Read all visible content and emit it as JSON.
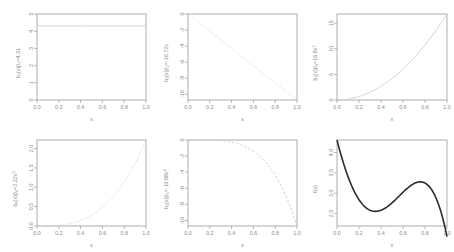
{
  "figure": {
    "layout": "2 rows x 3 columns of R base-graphics line plots",
    "background": "#ffffff",
    "light_curve_color": "#c9c9c9",
    "dark_curve_color": "#2b2b2b",
    "axis_color": "#9a9a9a",
    "text_color": "#8d8d8d"
  },
  "chart_data": [
    {
      "type": "line",
      "panel": 1,
      "title": "",
      "xlabel": "x",
      "ylabel": "b1(x)B1=4.31",
      "ylabel_parts": {
        "base": "b",
        "sub1": "1",
        "mid": "(x)β",
        "sub2": "1",
        "tail": "=4.31"
      },
      "xlim": [
        0,
        1
      ],
      "ylim": [
        0,
        5
      ],
      "xticks": [
        "0.0",
        "0.2",
        "0.4",
        "0.6",
        "0.8",
        "1.0"
      ],
      "xtickvals": [
        0,
        0.2,
        0.4,
        0.6,
        0.8,
        1
      ],
      "yticks": [
        "0",
        "1",
        "2",
        "3",
        "4",
        "5"
      ],
      "ytickvals": [
        0,
        1,
        2,
        3,
        4,
        5
      ],
      "linestyle": "solid",
      "color": "#c9c9c9",
      "expression": "4.31",
      "x": [
        0,
        0.1,
        0.2,
        0.3,
        0.4,
        0.5,
        0.6,
        0.7,
        0.8,
        0.9,
        1
      ],
      "values": [
        4.31,
        4.31,
        4.31,
        4.31,
        4.31,
        4.31,
        4.31,
        4.31,
        4.31,
        4.31,
        4.31
      ],
      "grid": false,
      "legend": "none"
    },
    {
      "type": "line",
      "panel": 2,
      "title": "",
      "xlabel": "x",
      "ylabel": "b2(x)B2=-10.72x",
      "ylabel_parts": {
        "base": "b",
        "sub1": "2",
        "mid": "(x)β",
        "sub2": "2",
        "tail": "=-10.72x"
      },
      "xlim": [
        0,
        1
      ],
      "ylim": [
        -10.72,
        0
      ],
      "xticks": [
        "0.0",
        "0.2",
        "0.4",
        "0.6",
        "0.8",
        "1.0"
      ],
      "xtickvals": [
        0,
        0.2,
        0.4,
        0.6,
        0.8,
        1
      ],
      "yticks": [
        "0",
        "-2",
        "-4",
        "-6",
        "-8",
        "-10"
      ],
      "ytickvals": [
        0,
        -2,
        -4,
        -6,
        -8,
        -10
      ],
      "linestyle": "dotted",
      "color": "#c9c9c9",
      "expression": "-10.72 * x",
      "x": [
        0,
        0.1,
        0.2,
        0.3,
        0.4,
        0.5,
        0.6,
        0.7,
        0.8,
        0.9,
        1
      ],
      "values": [
        0,
        -1.072,
        -2.144,
        -3.216,
        -4.288,
        -5.36,
        -6.432,
        -7.504,
        -8.576,
        -9.648,
        -10.72
      ],
      "grid": false,
      "legend": "none"
    },
    {
      "type": "line",
      "panel": 3,
      "title": "",
      "xlabel": "x",
      "ylabel": "b3(x)B3=16.8x2",
      "ylabel_parts": {
        "base": "b",
        "sub1": "3",
        "mid": "(x)β",
        "sub2": "3",
        "tail": "=16.8x",
        "sup": "2"
      },
      "xlim": [
        0,
        1
      ],
      "ylim": [
        0,
        16.8
      ],
      "xticks": [
        "0.0",
        "0.2",
        "0.4",
        "0.6",
        "0.8",
        "1.0"
      ],
      "xtickvals": [
        0,
        0.2,
        0.4,
        0.6,
        0.8,
        1
      ],
      "yticks": [
        "0",
        "5",
        "10",
        "15"
      ],
      "ytickvals": [
        0,
        5,
        10,
        15
      ],
      "linestyle": "solid",
      "color": "#c9c9c9",
      "expression": "16.8 * x^2",
      "x": [
        0,
        0.1,
        0.2,
        0.3,
        0.4,
        0.5,
        0.6,
        0.7,
        0.8,
        0.9,
        1
      ],
      "values": [
        0,
        0.168,
        0.672,
        1.512,
        2.688,
        4.2,
        6.048,
        8.232,
        10.752,
        13.608,
        16.8
      ],
      "grid": false,
      "legend": "none"
    },
    {
      "type": "line",
      "panel": 4,
      "title": "",
      "xlabel": "x",
      "ylabel": "b4(x)B4=2.22x3",
      "ylabel_parts": {
        "base": "b",
        "sub1": "4",
        "mid": "(x)β",
        "sub2": "4",
        "tail": "=2.22x",
        "sup": "3"
      },
      "xlim": [
        0,
        1
      ],
      "ylim": [
        0,
        2.22
      ],
      "xticks": [
        "0.0",
        "0.2",
        "0.4",
        "0.6",
        "0.8",
        "1.0"
      ],
      "xtickvals": [
        0,
        0.2,
        0.4,
        0.6,
        0.8,
        1
      ],
      "yticks": [
        "0.0",
        "0.5",
        "1.0",
        "1.5",
        "2.0"
      ],
      "ytickvals": [
        0,
        0.5,
        1,
        1.5,
        2
      ],
      "linestyle": "dotted",
      "color": "#c9c9c9",
      "expression": "2.22 * x^3",
      "x": [
        0,
        0.1,
        0.2,
        0.3,
        0.4,
        0.5,
        0.6,
        0.7,
        0.8,
        0.9,
        1
      ],
      "values": [
        0,
        0.00222,
        0.01776,
        0.05994,
        0.14208,
        0.2775,
        0.47952,
        0.76146,
        1.13664,
        1.61838,
        2.22
      ],
      "grid": false,
      "legend": "none"
    },
    {
      "type": "line",
      "panel": 5,
      "title": "",
      "xlabel": "x",
      "ylabel": "b5(x)B5=-10.68x4",
      "ylabel_parts": {
        "base": "b",
        "sub1": "5",
        "mid": "(x)β",
        "sub2": "5",
        "tail": "=-10.68x",
        "sup": "4"
      },
      "xlim": [
        0,
        1
      ],
      "ylim": [
        -10.68,
        0
      ],
      "xticks": [
        "0.0",
        "0.2",
        "0.4",
        "0.6",
        "0.8",
        "1.0"
      ],
      "xtickvals": [
        0,
        0.2,
        0.4,
        0.6,
        0.8,
        1
      ],
      "yticks": [
        "0",
        "-2",
        "-4",
        "-6",
        "-8",
        "-10"
      ],
      "ytickvals": [
        0,
        -2,
        -4,
        -6,
        -8,
        -10
      ],
      "linestyle": "dashed",
      "color": "#c9c9c9",
      "expression": "-10.68 * x^4",
      "x": [
        0,
        0.1,
        0.2,
        0.3,
        0.4,
        0.5,
        0.6,
        0.7,
        0.8,
        0.9,
        1
      ],
      "values": [
        0,
        -0.001068,
        -0.01709,
        -0.08651,
        -0.27341,
        -0.6675,
        -1.38413,
        -2.56403,
        -4.37453,
        -7.00714,
        -10.68
      ],
      "grid": false,
      "legend": "none"
    },
    {
      "type": "line",
      "panel": 6,
      "title": "",
      "xlabel": "x",
      "ylabel": "f(x)",
      "ylabel_parts": {
        "base": "f(x)"
      },
      "xlim": [
        0,
        1
      ],
      "ylim": [
        2.19,
        4.31
      ],
      "xticks": [
        "0.0",
        "0.2",
        "0.4",
        "0.6",
        "0.8",
        "1.0"
      ],
      "xtickvals": [
        0,
        0.2,
        0.4,
        0.6,
        0.8,
        1
      ],
      "yticks": [
        "2.5",
        "3.0",
        "3.5",
        "4.0"
      ],
      "ytickvals": [
        2.5,
        3,
        3.5,
        4
      ],
      "linestyle": "solid",
      "color": "#2b2b2b",
      "expression": "4.31 - 10.72x + 16.8x^2 + 2.22x^3 - 10.68x^4",
      "x": [
        0,
        0.1,
        0.2,
        0.3,
        0.4,
        0.5,
        0.6,
        0.7,
        0.8,
        0.9,
        1
      ],
      "values": [
        4.31,
        3.4,
        2.94,
        2.78,
        2.81,
        2.95,
        3.14,
        3.32,
        3.45,
        3.4,
        2.93
      ],
      "grid": false,
      "legend": "none"
    }
  ]
}
